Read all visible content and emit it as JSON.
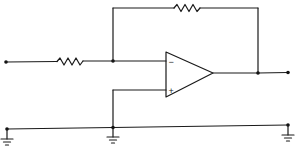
{
  "diagram": {
    "type": "circuit-schematic",
    "title": "",
    "components": [
      {
        "id": "R_in",
        "kind": "resistor",
        "label": ""
      },
      {
        "id": "R_f",
        "kind": "resistor",
        "label": ""
      },
      {
        "id": "U1",
        "kind": "op-amp",
        "inverting_input_label": "−",
        "non_inverting_input_label": "+"
      }
    ],
    "terminals": [
      {
        "id": "input",
        "label": ""
      },
      {
        "id": "output",
        "label": ""
      }
    ],
    "grounds": [
      {
        "id": "gnd-left"
      },
      {
        "id": "gnd-middle"
      },
      {
        "id": "gnd-right"
      }
    ],
    "colors": {
      "line": "#1a1a1a",
      "background": "#ffffff"
    }
  }
}
